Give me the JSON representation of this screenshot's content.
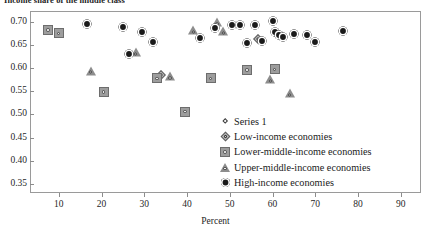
{
  "chart_data": {
    "type": "scatter",
    "title": "Income share of the middle class",
    "xlabel": "Percent",
    "ylabel": "",
    "xlim": [
      3.5,
      94.5
    ],
    "ylim": [
      0.332,
      0.722
    ],
    "xticks": [
      10,
      20,
      30,
      40,
      50,
      60,
      70,
      80,
      90
    ],
    "xtick_labels": [
      "10",
      "20",
      "30",
      "40",
      "50",
      "60",
      "70",
      "80",
      "90"
    ],
    "yticks": [
      0.35,
      0.4,
      0.45,
      0.5,
      0.55,
      0.6,
      0.65,
      0.7
    ],
    "ytick_labels": [
      "0.35",
      "0.40",
      "0.45",
      "0.50",
      "0.55",
      "0.60",
      "0.65",
      "0.70"
    ],
    "grid": false,
    "legend_position": "inside-lower-right",
    "series": [
      {
        "name": "Series 1",
        "marker": "small-open-diamond",
        "color": "#ffffff",
        "points": []
      },
      {
        "name": "Low-income economies",
        "marker": "open-diamond",
        "color": "#b9b9b9",
        "points": [
          {
            "x": 34.0,
            "y": 0.585
          },
          {
            "x": 56.5,
            "y": 0.663
          }
        ]
      },
      {
        "name": "Lower-middle-income economies",
        "marker": "grey-square",
        "color": "#9d9d9d",
        "points": [
          {
            "x": 7.5,
            "y": 0.683
          },
          {
            "x": 10.0,
            "y": 0.676
          },
          {
            "x": 20.5,
            "y": 0.549
          },
          {
            "x": 33.0,
            "y": 0.578
          },
          {
            "x": 39.5,
            "y": 0.506
          },
          {
            "x": 45.5,
            "y": 0.578
          },
          {
            "x": 54.0,
            "y": 0.596
          },
          {
            "x": 60.5,
            "y": 0.598
          }
        ]
      },
      {
        "name": "Upper-middle-income economies",
        "marker": "grey-triangle",
        "color": "#8d8d8d",
        "points": [
          {
            "x": 17.5,
            "y": 0.595
          },
          {
            "x": 28.0,
            "y": 0.635
          },
          {
            "x": 36.0,
            "y": 0.583
          },
          {
            "x": 41.5,
            "y": 0.682
          },
          {
            "x": 47.0,
            "y": 0.7
          },
          {
            "x": 48.5,
            "y": 0.681
          },
          {
            "x": 59.5,
            "y": 0.576
          },
          {
            "x": 64.0,
            "y": 0.546
          }
        ]
      },
      {
        "name": "High-income economies",
        "marker": "filled-circle",
        "color": "#1a1a1a",
        "points": [
          {
            "x": 16.5,
            "y": 0.696
          },
          {
            "x": 25.0,
            "y": 0.689
          },
          {
            "x": 26.5,
            "y": 0.63
          },
          {
            "x": 29.5,
            "y": 0.678
          },
          {
            "x": 32.0,
            "y": 0.658
          },
          {
            "x": 43.0,
            "y": 0.665
          },
          {
            "x": 46.5,
            "y": 0.688
          },
          {
            "x": 50.5,
            "y": 0.693
          },
          {
            "x": 52.5,
            "y": 0.693
          },
          {
            "x": 54.0,
            "y": 0.655
          },
          {
            "x": 56.0,
            "y": 0.693
          },
          {
            "x": 57.5,
            "y": 0.659
          },
          {
            "x": 60.0,
            "y": 0.703
          },
          {
            "x": 60.5,
            "y": 0.678
          },
          {
            "x": 61.5,
            "y": 0.673
          },
          {
            "x": 62.5,
            "y": 0.667
          },
          {
            "x": 65.0,
            "y": 0.674
          },
          {
            "x": 68.0,
            "y": 0.672
          },
          {
            "x": 70.0,
            "y": 0.658
          },
          {
            "x": 76.5,
            "y": 0.68
          }
        ]
      }
    ]
  },
  "legend": {
    "items": [
      {
        "label": "Series 1",
        "marker": "series1"
      },
      {
        "label": "Low-income economies",
        "marker": "low"
      },
      {
        "label": "Lower-middle-income economies",
        "marker": "lowermid"
      },
      {
        "label": "Upper-middle-income economies",
        "marker": "uppermid"
      },
      {
        "label": "High-income economies",
        "marker": "high"
      }
    ]
  }
}
